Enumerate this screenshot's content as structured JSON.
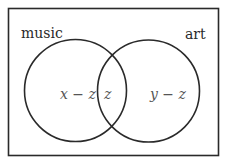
{
  "diagram": {
    "type": "venn",
    "sets": [
      {
        "label": "music",
        "region_label": "x − z"
      },
      {
        "label": "art",
        "region_label": "y − z"
      }
    ],
    "intersection_label": "z",
    "colors": {
      "stroke": "#2a2a2a",
      "background": "#ffffff"
    }
  }
}
